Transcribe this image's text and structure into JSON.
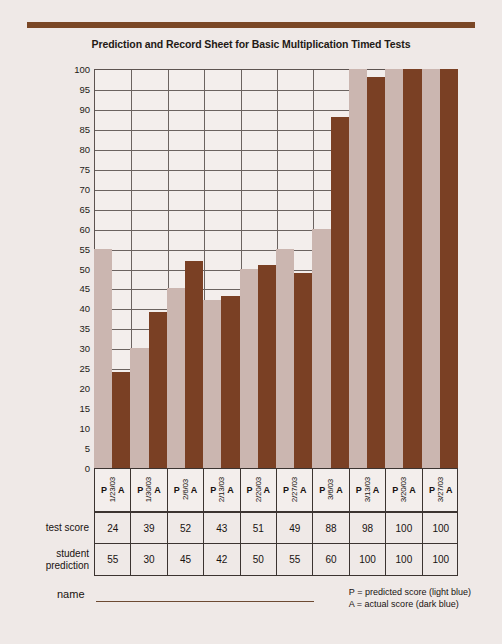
{
  "sheet": {
    "title": "Prediction and Record Sheet for Basic Multiplication Timed Tests",
    "name_label": "name",
    "legend": {
      "predicted": "P = predicted score (light blue)",
      "actual": "A = actual score (dark blue)"
    }
  },
  "table": {
    "row_labels": {
      "test_score": "test score",
      "student_prediction": "student prediction"
    }
  },
  "axis": {
    "p_label": "P",
    "a_label": "A"
  },
  "chart_data": {
    "type": "bar",
    "title": "Prediction and Record Sheet for Basic Multiplication Timed Tests",
    "xlabel": "",
    "ylabel": "",
    "ylim": [
      0,
      100
    ],
    "ytick_step": 5,
    "yticks": [
      0,
      5,
      10,
      15,
      20,
      25,
      30,
      35,
      40,
      45,
      50,
      55,
      60,
      65,
      70,
      75,
      80,
      85,
      90,
      95,
      100
    ],
    "grid": true,
    "legend_position": "bottom-right",
    "categories": [
      "1/23/03",
      "1/30/03",
      "2/6/03",
      "2/13/03",
      "2/20/03",
      "2/27/03",
      "3/6/03",
      "3/13/03",
      "3/20/03",
      "3/27/03"
    ],
    "series": [
      {
        "name": "student prediction",
        "short": "P",
        "color": "#cbb6b0",
        "values": [
          55,
          30,
          45,
          42,
          50,
          55,
          60,
          100,
          100,
          100
        ]
      },
      {
        "name": "test score",
        "short": "A",
        "color": "#7a4024",
        "values": [
          24,
          39,
          52,
          43,
          51,
          49,
          88,
          98,
          100,
          100
        ]
      }
    ]
  },
  "colors": {
    "rule": "#7a4726",
    "predicted_bar": "#cbb6b0",
    "actual_bar": "#7a4024",
    "grid": "#6b6360",
    "paper": "#efe9e7"
  }
}
